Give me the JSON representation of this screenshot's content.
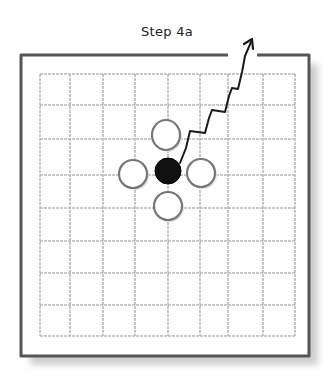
{
  "title": "Step 4a",
  "board": {
    "outer": {
      "x": 21,
      "y": 55,
      "w": 288,
      "h": 301
    },
    "top_gap": {
      "from_x": 228,
      "to_x": 257
    },
    "grid": {
      "x_lines": [
        40,
        70,
        103,
        135,
        168,
        200,
        228,
        263,
        295
      ],
      "y_lines": [
        74,
        105,
        139,
        175,
        208,
        241,
        273,
        305,
        336
      ]
    },
    "stones": [
      {
        "color": "black",
        "cx": 168,
        "cy": 171,
        "rx": 13,
        "ry": 13
      },
      {
        "color": "white",
        "cx": 166,
        "cy": 135,
        "rx": 14,
        "ry": 15
      },
      {
        "color": "white",
        "cx": 133,
        "cy": 174,
        "rx": 14,
        "ry": 14
      },
      {
        "color": "white",
        "cx": 201,
        "cy": 173,
        "rx": 14,
        "ry": 14
      },
      {
        "color": "white",
        "cx": 168,
        "cy": 206,
        "rx": 14,
        "ry": 14
      }
    ],
    "escape_path": "M180,163 L186,148 L190,131 L205,133 L209,118 L212,110 L225,112 L229,96 L232,88 L238,89 L242,72 L245,56 L251,42",
    "colors": {
      "border": "#555555",
      "grid": "#b8b8b8",
      "stone_outline": "#777777",
      "black_stone": "#111111",
      "path": "#1a1a1a"
    }
  }
}
